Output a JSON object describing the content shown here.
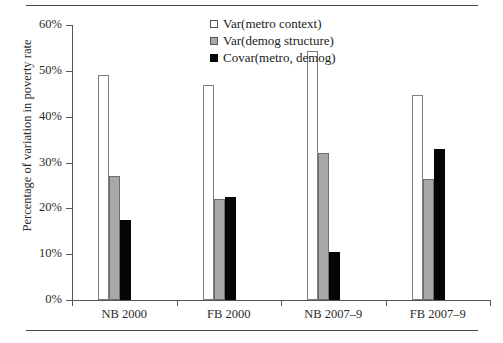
{
  "chart_data": {
    "type": "bar",
    "title": "",
    "xlabel": "",
    "ylabel": "Percentage of variation in poverty rate",
    "categories": [
      "NB 2000",
      "FB 2000",
      "NB 2007–9",
      "FB 2007–9"
    ],
    "series": [
      {
        "name": "Var(metro context)",
        "values": [
          49.1,
          47.0,
          54.4,
          44.7
        ],
        "color": "#ffffff"
      },
      {
        "name": "Var(demog structure)",
        "values": [
          27.1,
          22.1,
          32.1,
          26.4
        ],
        "color": "#a8a8a8"
      },
      {
        "name": "Covar(metro, demog)",
        "values": [
          17.5,
          22.5,
          10.5,
          33.0
        ],
        "color": "#050505"
      }
    ],
    "ylim": [
      0,
      60
    ],
    "ytick_values": [
      0,
      10,
      20,
      30,
      40,
      50,
      60
    ],
    "ytick_labels": [
      "0%",
      "10%",
      "20%",
      "30%",
      "40%",
      "50%",
      "60%"
    ],
    "grid": false,
    "legend_position": "top-center"
  },
  "figure": {
    "rule_top": "",
    "rule_bottom": ""
  }
}
